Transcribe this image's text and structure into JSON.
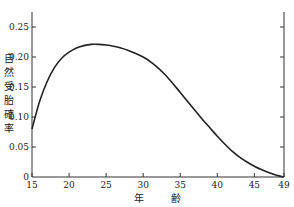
{
  "chart_data": {
    "type": "line",
    "title": "",
    "xlabel": "年 齢",
    "ylabel": "自然受胎確率",
    "xlim": [
      15,
      49
    ],
    "ylim": [
      0,
      0.28
    ],
    "x_ticks": [
      "15",
      "20",
      "25",
      "30",
      "35",
      "40",
      "45",
      "49"
    ],
    "y_ticks": [
      "0",
      "0.05",
      "0.10",
      "0.15",
      "0.20",
      "0.25"
    ],
    "grid": false,
    "legend": null,
    "series": [
      {
        "name": "自然受胎確率",
        "x": [
          15,
          16,
          17,
          18,
          19,
          20,
          21,
          22,
          23,
          24,
          25,
          26,
          27,
          28,
          29,
          30,
          31,
          32,
          33,
          34,
          35,
          36,
          37,
          38,
          39,
          40,
          41,
          42,
          43,
          44,
          45,
          46,
          47,
          48,
          49
        ],
        "values": [
          0.08,
          0.125,
          0.158,
          0.182,
          0.198,
          0.208,
          0.215,
          0.219,
          0.221,
          0.221,
          0.22,
          0.218,
          0.215,
          0.211,
          0.206,
          0.2,
          0.192,
          0.182,
          0.17,
          0.156,
          0.141,
          0.126,
          0.111,
          0.096,
          0.082,
          0.068,
          0.055,
          0.043,
          0.033,
          0.025,
          0.018,
          0.012,
          0.007,
          0.003,
          0.0
        ]
      }
    ]
  },
  "axes": {
    "x_label_parts": [
      "年",
      "齢"
    ],
    "y_label_chars": [
      "自",
      "然",
      "受",
      "胎",
      "確",
      "率"
    ]
  }
}
